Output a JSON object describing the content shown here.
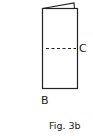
{
  "figure": {
    "caption": "Fig. 3b",
    "labels": {
      "fold_line": "C",
      "bottom_edge": "B"
    },
    "stroke_color": "#222222",
    "background": "#ffffff"
  }
}
